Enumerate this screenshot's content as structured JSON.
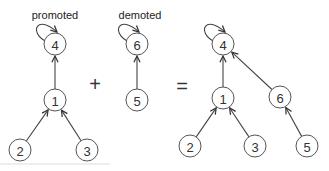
{
  "labels": {
    "promoted": "promoted",
    "demoted": "demoted"
  },
  "operators": {
    "plus": "+",
    "equals": "="
  },
  "trees": {
    "promoted": {
      "nodes": [
        {
          "id": "4",
          "label": "4",
          "x": 55,
          "y": 44
        },
        {
          "id": "1",
          "label": "1",
          "x": 55,
          "y": 100
        },
        {
          "id": "2",
          "label": "2",
          "x": 20,
          "y": 150
        },
        {
          "id": "3",
          "label": "3",
          "x": 87,
          "y": 150
        }
      ],
      "edges": [
        [
          "1",
          "4"
        ],
        [
          "2",
          "1"
        ],
        [
          "3",
          "1"
        ]
      ],
      "self_loop": "4"
    },
    "demoted": {
      "nodes": [
        {
          "id": "6",
          "label": "6",
          "x": 137,
          "y": 44
        },
        {
          "id": "5",
          "label": "5",
          "x": 137,
          "y": 100
        }
      ],
      "edges": [
        [
          "5",
          "6"
        ]
      ],
      "self_loop": "6"
    },
    "result": {
      "nodes": [
        {
          "id": "4",
          "label": "4",
          "x": 223,
          "y": 44
        },
        {
          "id": "1",
          "label": "1",
          "x": 223,
          "y": 98
        },
        {
          "id": "2",
          "label": "2",
          "x": 190,
          "y": 146
        },
        {
          "id": "3",
          "label": "3",
          "x": 255,
          "y": 146
        },
        {
          "id": "6",
          "label": "6",
          "x": 280,
          "y": 97
        },
        {
          "id": "5",
          "label": "5",
          "x": 307,
          "y": 146
        }
      ],
      "edges": [
        [
          "1",
          "4"
        ],
        [
          "2",
          "1"
        ],
        [
          "3",
          "1"
        ],
        [
          "6",
          "4"
        ],
        [
          "5",
          "6"
        ]
      ],
      "self_loop": "4"
    }
  }
}
